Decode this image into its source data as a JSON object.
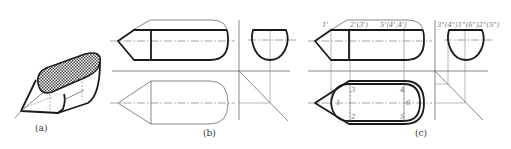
{
  "figure": {
    "panels": [
      {
        "id": "a",
        "caption": "(a)",
        "description": "isometric view of truncated pointed cylinder with cut plane shaded"
      },
      {
        "id": "b",
        "caption": "(b)",
        "description": "front, side and incomplete top view"
      },
      {
        "id": "c",
        "caption": "(c)",
        "description": "completed three views with point labels"
      }
    ],
    "labels_c": {
      "front_top_1": "1'",
      "front_top_2": "2'(3')",
      "front_top_3": "5'(4',4')",
      "side_top": "3\"(4\")1\"(6\")2\"(5\")",
      "plan_1": "1",
      "plan_2": "2",
      "plan_3": "3",
      "plan_4": "4",
      "plan_5": "5",
      "plan_6": "6"
    },
    "colors": {
      "line": "#1a1a1a",
      "thin_line": "#555555",
      "shading": "#555555",
      "background": "#ffffff"
    }
  }
}
